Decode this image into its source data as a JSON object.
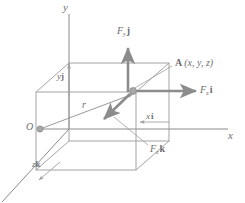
{
  "diagram": {
    "colors": {
      "box_line": "#9a9a9a",
      "axis_line": "#8a8a8a",
      "force_arrow": "#8c8c8c",
      "thin_arrow": "#a0a0a0",
      "text": "#6e6e6e",
      "node_fill": "#a8a8a8",
      "background": "#ffffff"
    },
    "axes": [
      {
        "id": "y-axis",
        "label": "y",
        "direction": "up"
      },
      {
        "id": "x-axis",
        "label": "x",
        "direction": "right"
      },
      {
        "id": "z-axis",
        "label": "",
        "direction": "down-left"
      }
    ],
    "points": [
      {
        "id": "origin",
        "label": "O",
        "x": 40,
        "y": 129
      },
      {
        "id": "point-a",
        "label": "A",
        "x": 136,
        "y": 92
      }
    ],
    "point_a_label": {
      "name": "A",
      "coords": "(x, y, z)"
    },
    "position_vector": {
      "label": "r",
      "from": "O",
      "to": "A"
    },
    "force_components": [
      {
        "id": "fy",
        "symbol": "F",
        "sub": "y",
        "unit": "j",
        "direction": "up"
      },
      {
        "id": "fx",
        "symbol": "F",
        "sub": "x",
        "unit": "i",
        "direction": "right"
      },
      {
        "id": "fz",
        "symbol": "F",
        "sub": "z",
        "unit": "k",
        "direction": "down-left"
      }
    ],
    "coordinate_labels": [
      {
        "id": "yj",
        "value": "y",
        "unit": "j"
      },
      {
        "id": "xi",
        "value": "x",
        "unit": "i"
      },
      {
        "id": "zk",
        "value": "z",
        "unit": "k"
      }
    ]
  }
}
